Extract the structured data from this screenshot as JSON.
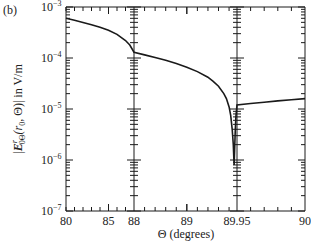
{
  "panel_label": "(b)",
  "chart_data": {
    "type": "line",
    "title": "",
    "panel": "(b)",
    "xlabel": "Θ (degrees)",
    "ylabel": "|E^r_0Θ(r0, Θ)| in V/m",
    "ylabel_parts": {
      "prefix": "|",
      "E": "E",
      "sup": "r",
      "sub": "0Θ",
      "args": "(r",
      "argsub": "0",
      "rest": ", Θ)| in V/m"
    },
    "yscale": "log",
    "ylim": [
      1e-07,
      0.001
    ],
    "ytick_labels": [
      {
        "value": -3,
        "label": "10",
        "exp": "−3"
      },
      {
        "value": -4,
        "label": "10",
        "exp": "−4"
      },
      {
        "value": -5,
        "label": "10",
        "exp": "−5"
      },
      {
        "value": -6,
        "label": "10",
        "exp": "−6"
      },
      {
        "value": -7,
        "label": "10",
        "exp": "−7"
      }
    ],
    "x_segments": [
      {
        "range": [
          80,
          88
        ],
        "ticks_major": [
          80,
          85
        ],
        "ticks_minor_step": 1
      },
      {
        "range": [
          88,
          89.95
        ],
        "ticks_major": [
          88,
          89
        ],
        "ticks_minor_step": 0.2
      },
      {
        "range": [
          89.95,
          90
        ],
        "ticks_major": [
          89.95,
          90
        ],
        "ticks_minor_step": 0.01
      }
    ],
    "xtick_labels": [
      "80",
      "85",
      "88",
      "89",
      "89.95",
      "90"
    ],
    "grid": false,
    "legend": null,
    "series": [
      {
        "name": "|E^r_0Θ|",
        "x": [
          80,
          81,
          82,
          83,
          84,
          85,
          86,
          87,
          87.5,
          88,
          88.2,
          88.4,
          88.6,
          88.8,
          89.0,
          89.2,
          89.4,
          89.5,
          89.6,
          89.7,
          89.75,
          89.8,
          89.83,
          89.86,
          89.88,
          89.895,
          89.905,
          89.915,
          89.93,
          89.95,
          89.96,
          89.97,
          89.98,
          89.99,
          90
        ],
        "y": [
          0.0006,
          0.00055,
          0.0005,
          0.00045,
          0.0004,
          0.00035,
          0.00029,
          0.00022,
          0.00018,
          0.00013,
          0.000115,
          0.000102,
          9e-05,
          7.8e-05,
          6.6e-05,
          5.4e-05,
          4.2e-05,
          3.5e-05,
          2.8e-05,
          2e-05,
          1.6e-05,
          1.1e-05,
          7.5e-06,
          4e-06,
          2e-06,
          8e-07,
          1.5e-06,
          3.5e-06,
          7e-06,
          1.2e-05,
          1.28e-05,
          1.36e-05,
          1.44e-05,
          1.52e-05,
          1.6e-05
        ]
      }
    ]
  }
}
